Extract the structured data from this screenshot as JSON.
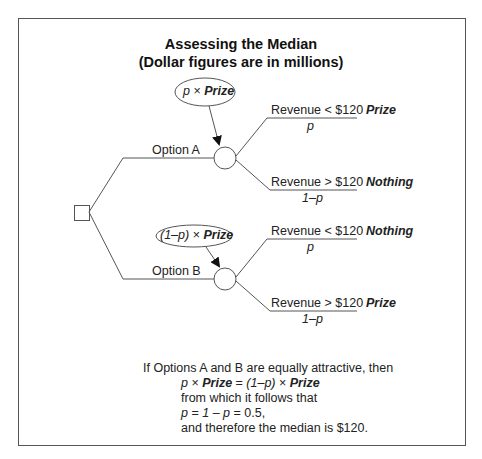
{
  "title": {
    "line1": "Assessing the Median",
    "line2": "(Dollar figures are in millions)"
  },
  "tree": {
    "decision_node": "decision-square",
    "options": [
      {
        "label": "Option A",
        "value_bubble": {
          "prefix": "p",
          "times": " × ",
          "bold": "Prize"
        },
        "outcomes": [
          {
            "condition": "Revenue < $120",
            "probability": "p",
            "payoff": "Prize"
          },
          {
            "condition": "Revenue > $120",
            "probability": "1–p",
            "payoff": "Nothing"
          }
        ]
      },
      {
        "label": "Option B",
        "value_bubble": {
          "prefix": "(1–p)",
          "times": " × ",
          "bold": "Prize"
        },
        "outcomes": [
          {
            "condition": "Revenue < $120",
            "probability": "p",
            "payoff": "Nothing"
          },
          {
            "condition": "Revenue > $120",
            "probability": "1–p",
            "payoff": "Prize"
          }
        ]
      }
    ]
  },
  "conclusion": {
    "line1": "If Options A and B are equally attractive, then",
    "line2": {
      "a": "p",
      "b": " × ",
      "c": "Prize",
      "d": " = ",
      "e": "(1–p)",
      "f": " × ",
      "g": "Prize"
    },
    "line3": "from which it follows that",
    "line4": {
      "a": "p",
      "b": " = ",
      "c": "1",
      "d": " – ",
      "e": "p",
      "f": " = 0.5,"
    },
    "line5": "and therefore the median is $120."
  },
  "colors": {
    "line": "#555555",
    "text": "#222222",
    "frame": "#555555"
  }
}
